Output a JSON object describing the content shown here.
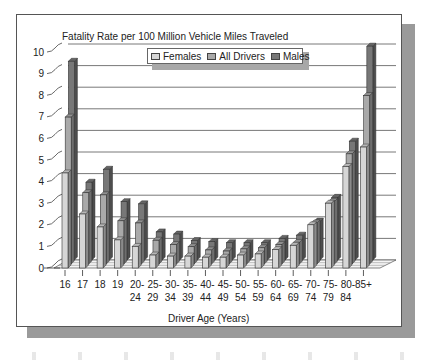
{
  "chart_data": {
    "type": "bar",
    "style": "3d-clustered",
    "title": "Fatality Rate per 100 Million Vehicle Miles Traveled",
    "xlabel": "Driver Age (Years)",
    "ylabel": "",
    "ylim": [
      0,
      10
    ],
    "yticks": [
      0,
      1,
      2,
      3,
      4,
      5,
      6,
      7,
      8,
      9,
      10
    ],
    "grid": true,
    "legend_position": "top-center",
    "categories": [
      "16",
      "17",
      "18",
      "19",
      "20-24",
      "25-29",
      "30-34",
      "35-39",
      "40-44",
      "45-49",
      "50-54",
      "55-59",
      "60-64",
      "65-69",
      "70-74",
      "75-79",
      "80-84",
      "85+"
    ],
    "category_labels": [
      [
        "16"
      ],
      [
        "17"
      ],
      [
        "18"
      ],
      [
        "19"
      ],
      [
        "20-",
        "24"
      ],
      [
        "25-",
        "29"
      ],
      [
        "30-",
        "34"
      ],
      [
        "35-",
        "39"
      ],
      [
        "40-",
        "44"
      ],
      [
        "45-",
        "49"
      ],
      [
        "50-",
        "54"
      ],
      [
        "55-",
        "59"
      ],
      [
        "60-",
        "64"
      ],
      [
        "65-",
        "69"
      ],
      [
        "70-",
        "74"
      ],
      [
        "75-",
        "79"
      ],
      [
        "80-",
        "84"
      ],
      [
        "85+"
      ]
    ],
    "series": [
      {
        "name": "Females",
        "color": "#d6d6d6",
        "values": [
          4.4,
          2.5,
          1.9,
          1.3,
          1.0,
          0.6,
          0.55,
          0.55,
          0.5,
          0.5,
          0.6,
          0.65,
          0.85,
          1.05,
          2.0,
          3.0,
          4.7,
          5.6
        ]
      },
      {
        "name": "All Drivers",
        "color": "#a9a9a9",
        "values": [
          6.8,
          3.3,
          3.2,
          2.0,
          1.9,
          1.1,
          0.9,
          0.8,
          0.65,
          0.6,
          0.7,
          0.75,
          0.9,
          1.0,
          1.9,
          2.9,
          5.1,
          7.8
        ]
      },
      {
        "name": "Males",
        "color": "#777777",
        "values": [
          9.2,
          3.6,
          4.2,
          2.7,
          2.6,
          1.3,
          1.2,
          0.9,
          0.85,
          0.8,
          0.8,
          0.8,
          1.0,
          1.15,
          1.8,
          2.9,
          5.5,
          9.9
        ]
      }
    ]
  },
  "legend": {
    "items": [
      {
        "label": "Females",
        "color": "#d6d6d6"
      },
      {
        "label": "All Drivers",
        "color": "#a9a9a9"
      },
      {
        "label": "Males",
        "color": "#777777"
      }
    ]
  }
}
